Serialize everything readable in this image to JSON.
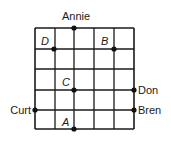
{
  "diagram": {
    "type": "grid-map",
    "grid": {
      "columns": 5,
      "rows": 5,
      "x_lines": [
        35,
        55,
        74,
        94,
        114,
        134
      ],
      "y_lines": [
        28,
        49,
        69,
        90,
        110,
        129
      ],
      "line_color": "#1a1a1a"
    },
    "people": [
      {
        "name": "Annie",
        "x": 74,
        "y": 28,
        "label_x": 76,
        "label_y": 20,
        "anchor": "middle",
        "edge": "top"
      },
      {
        "name": "Curt",
        "x": 35,
        "y": 110,
        "label_x": 31,
        "label_y": 114,
        "anchor": "end",
        "edge": "left"
      },
      {
        "name": "Don",
        "x": 134,
        "y": 90,
        "label_x": 138,
        "label_y": 94,
        "anchor": "start",
        "edge": "right"
      },
      {
        "name": "Bren",
        "x": 134,
        "y": 110,
        "label_x": 138,
        "label_y": 114,
        "anchor": "start",
        "edge": "right"
      }
    ],
    "points": [
      {
        "label": "A",
        "x": 74,
        "y": 129,
        "label_x": 62,
        "label_y": 126
      },
      {
        "label": "B",
        "x": 114,
        "y": 49,
        "label_x": 101,
        "label_y": 45
      },
      {
        "label": "C",
        "x": 74,
        "y": 90,
        "label_x": 62,
        "label_y": 86
      },
      {
        "label": "D",
        "x": 54,
        "y": 49,
        "label_x": 41,
        "label_y": 45
      }
    ],
    "dot_color": "#111111",
    "dot_radius": 2.6
  }
}
